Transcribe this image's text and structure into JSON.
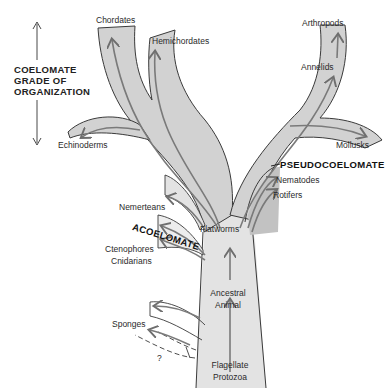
{
  "diagram": {
    "type": "phylogenetic-tree",
    "colors": {
      "branch_fill": "#d2d2d2",
      "branch_outline": "#3a3a3a",
      "arrow": "#7a7a7a",
      "text": "#2a2a2a"
    },
    "grade_label": {
      "line1": "COELOMATE",
      "line2": "GRADE OF",
      "line3": "ORGANIZATION"
    },
    "section_labels": {
      "pseudocoelomate": "PSEUDOCOELOMATE",
      "acoelomate": "ACOELOMATE"
    },
    "taxa": {
      "chordates": "Chordates",
      "hemichordates": "Hemichordates",
      "echinoderms": "Echinoderms",
      "arthropods": "Arthropods",
      "annelids": "Annelids",
      "mollusks": "Mollusks",
      "nematodes": "Nematodes",
      "rotifers": "Rotifers",
      "nemerteans": "Nemerteans",
      "flatworms": "Flatworms",
      "ctenophores": "Ctenophores",
      "cnidarians": "Cnidarians",
      "ancestral_line1": "Ancestral",
      "ancestral_line2": "Animal",
      "sponges": "Sponges",
      "unknown": "?",
      "flagellate_line1": "Flagellate",
      "flagellate_line2": "Protozoa"
    }
  }
}
